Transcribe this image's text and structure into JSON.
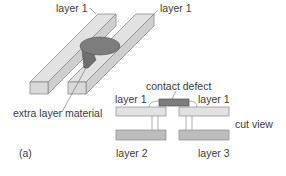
{
  "figure": {
    "panel_label": "(a)",
    "perspective_view": {
      "labels": {
        "layer_left": "layer 1",
        "layer_right": "layer 1",
        "defect": "extra layer material"
      }
    },
    "cut_view": {
      "title": "cut view",
      "labels": {
        "defect": "contact defect",
        "top_left": "layer 1",
        "top_right": "layer 1",
        "bottom_left": "layer 2",
        "bottom_right": "layer 3"
      }
    },
    "colors": {
      "bar_light": "#e2e2e2",
      "bar_side": "#c8c8c8",
      "bar_dark": "#bdbdbd",
      "defect": "#7d7d7d",
      "outline": "#8a8a8a"
    }
  }
}
